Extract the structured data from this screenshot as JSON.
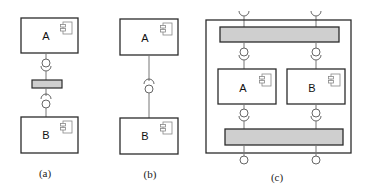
{
  "diagram": {
    "panels": [
      {
        "caption": "(a)",
        "components": [
          {
            "label": "A"
          },
          {
            "label": "B"
          }
        ],
        "description": "Two components connected via an intermediate connector bar using provided/required interfaces"
      },
      {
        "caption": "(b)",
        "components": [
          {
            "label": "A"
          },
          {
            "label": "B"
          }
        ],
        "description": "Two components directly connected via ball-and-socket interface"
      },
      {
        "caption": "(c)",
        "components": [
          {
            "label": "A"
          },
          {
            "label": "B"
          }
        ],
        "description": "Composite component enclosing A and B, with upper and lower connector bars and external interfaces"
      }
    ],
    "colors": {
      "stroke": "#2b2b2b",
      "line": "#777777",
      "connector_fill": "#cfcfcf",
      "background": "#ffffff",
      "component_icon": "#888888"
    },
    "icons": [
      "component-icon",
      "provided-interface-icon",
      "required-interface-icon"
    ]
  }
}
